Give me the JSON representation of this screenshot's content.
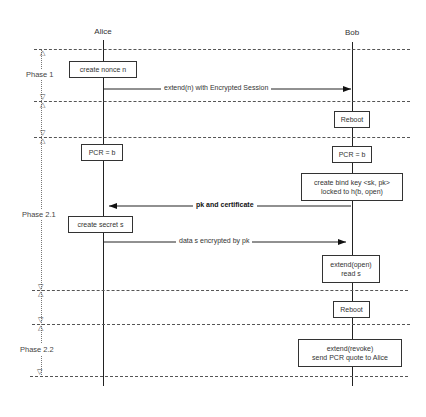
{
  "actors": {
    "alice": "Alice",
    "bob": "Bob"
  },
  "phases": [
    {
      "label": "Phase 1"
    },
    {
      "label": "Phase 2.1"
    },
    {
      "label": "Phase 2.2"
    }
  ],
  "alice_boxes": {
    "create_nonce": "create nonce  n",
    "pcr_b": "PCR = b",
    "create_secret": "create secret s"
  },
  "bob_boxes": {
    "reboot_1": "Reboot",
    "pcr_b": "PCR = b",
    "create_bind_key_line1": "create bind key <sk, pk>",
    "create_bind_key_line2": "locked to h(b, open)",
    "extend_open_line1": "extend(open)",
    "extend_open_line2": "read s",
    "reboot_2": "Reboot",
    "extend_revoke_line1": "extend(revoke)",
    "extend_revoke_line2": "send PCR quote to Alice"
  },
  "messages": {
    "extend_n": "extend(n) with Encrypted Session",
    "pk_cert": "pk and certificate",
    "data_s": "data s encrypted by pk"
  },
  "markers": {
    "down": "▽",
    "up": "△"
  }
}
